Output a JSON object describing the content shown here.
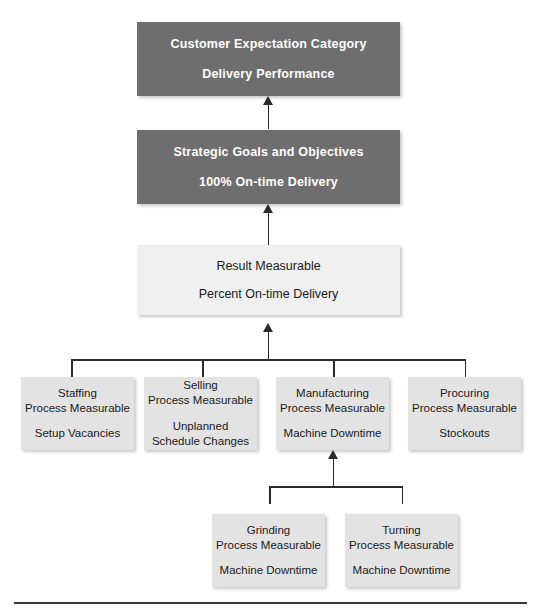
{
  "diagram": {
    "colors": {
      "dark_box": "#6e6e6e",
      "dark_box_text": "#ffffff",
      "result_box": "#f0f0f0",
      "process_box": "#e3e3e3",
      "box_text": "#1a1a1a",
      "connector": "#2b2b2b",
      "background": "#ffffff"
    },
    "levels": [
      {
        "id": "customer-expectation",
        "label": "Customer Expectation Category",
        "value": "Delivery Performance",
        "style": "dark"
      },
      {
        "id": "strategic-goals",
        "label": "Strategic Goals and Objectives",
        "value": "100% On-time Delivery",
        "style": "dark"
      },
      {
        "id": "result-measurable",
        "label": "Result Measurable",
        "value": "Percent On-time Delivery",
        "style": "result"
      }
    ],
    "process_measurables": [
      {
        "id": "staffing",
        "function": "Staffing",
        "type": "Process Measurable",
        "measure_line1": "Setup Vacancies",
        "measure_line2": ""
      },
      {
        "id": "selling",
        "function": "Selling",
        "type": "Process Measurable",
        "measure_line1": "Unplanned",
        "measure_line2": "Schedule Changes"
      },
      {
        "id": "manufacturing",
        "function": "Manufacturing",
        "type": "Process Measurable",
        "measure_line1": "Machine Downtime",
        "measure_line2": ""
      },
      {
        "id": "procuring",
        "function": "Procuring",
        "type": "Process Measurable",
        "measure_line1": "Stockouts",
        "measure_line2": ""
      }
    ],
    "sub_process_measurables": [
      {
        "id": "grinding",
        "function": "Grinding",
        "type": "Process Measurable",
        "measure_line1": "Machine Downtime",
        "measure_line2": ""
      },
      {
        "id": "turning",
        "function": "Turning",
        "type": "Process Measurable",
        "measure_line1": "Machine Downtime",
        "measure_line2": ""
      }
    ]
  }
}
